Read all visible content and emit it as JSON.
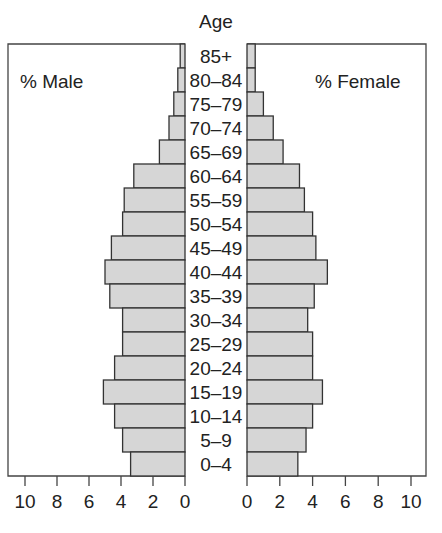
{
  "chart_data": {
    "type": "bar",
    "subtype": "population-pyramid",
    "title": "Age",
    "left_label": "% Male",
    "right_label": "% Female",
    "categories": [
      "85+",
      "80–84",
      "75–79",
      "70–74",
      "65–69",
      "60–64",
      "55–59",
      "50–54",
      "45–49",
      "40–44",
      "35–39",
      "30–34",
      "25–29",
      "20–24",
      "15–19",
      "10–14",
      "5–9",
      "0–4"
    ],
    "series": [
      {
        "name": "% Male",
        "side": "left",
        "values": [
          0.3,
          0.45,
          0.7,
          1.0,
          1.6,
          3.2,
          3.8,
          3.9,
          4.6,
          5.0,
          4.7,
          3.9,
          3.9,
          4.4,
          5.1,
          4.4,
          3.9,
          3.4
        ]
      },
      {
        "name": "% Female",
        "side": "right",
        "values": [
          0.5,
          0.5,
          1.0,
          1.6,
          2.2,
          3.2,
          3.5,
          4.0,
          4.2,
          4.9,
          4.1,
          3.7,
          4.0,
          4.0,
          4.6,
          4.0,
          3.6,
          3.1
        ]
      }
    ],
    "xlabel": "",
    "ylabel": "Age",
    "x_ticks_left": [
      "10",
      "8",
      "6",
      "4",
      "2",
      "0"
    ],
    "x_ticks_right": [
      "0",
      "2",
      "4",
      "6",
      "8",
      "10"
    ],
    "xlim": [
      0,
      10
    ],
    "grid": false,
    "colors": {
      "bar_fill": "#d6d6d6",
      "bar_stroke": "#333333",
      "frame": "#444444"
    }
  }
}
